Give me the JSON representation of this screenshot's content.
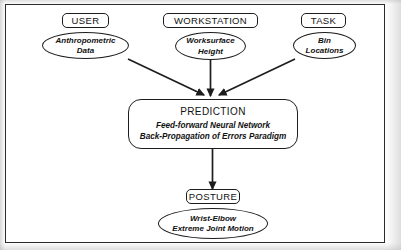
{
  "figure": {
    "type": "flow-diagram",
    "background_color": "#ffffff",
    "stroke_color": "#1d1d1d",
    "frame_color": "#2b2b2b"
  },
  "inputs": [
    {
      "category_label": "USER",
      "detail_lines": [
        "Anthropometric",
        "Data"
      ]
    },
    {
      "category_label": "WORKSTATION",
      "detail_lines": [
        "Worksurface",
        "Height"
      ]
    },
    {
      "category_label": "TASK",
      "detail_lines": [
        "Bin",
        "Locations"
      ]
    }
  ],
  "process": {
    "title": "PREDICTION",
    "lines": [
      "Feed-forward Neural Network",
      "Back-Propagation of Errors Paradigm"
    ]
  },
  "output": {
    "category_label": "POSTURE",
    "detail_lines": [
      "Wrist-Elbow",
      "Extreme Joint Motion"
    ]
  },
  "connectors": [
    {
      "name": "user-to-prediction",
      "from": "Anthropometric Data",
      "to": "PREDICTION",
      "style": "diagonal-arrow"
    },
    {
      "name": "workstation-to-prediction",
      "from": "Worksurface Height",
      "to": "PREDICTION",
      "style": "vertical-arrow"
    },
    {
      "name": "task-to-prediction",
      "from": "Bin Locations",
      "to": "PREDICTION",
      "style": "diagonal-arrow"
    },
    {
      "name": "prediction-to-posture",
      "from": "PREDICTION",
      "to": "POSTURE",
      "style": "vertical-arrow"
    }
  ]
}
